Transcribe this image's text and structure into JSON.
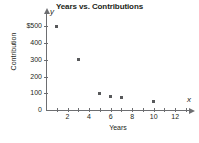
{
  "chart_data": {
    "type": "scatter",
    "title": "Years vs. Contributions",
    "xlabel": "Years",
    "ylabel": "Contribution",
    "x_axis_letter": "x",
    "y_axis_letter": "y",
    "xlim": [
      0,
      13
    ],
    "ylim": [
      0,
      550
    ],
    "grid": false,
    "legend": false,
    "marker_color": "#58595b",
    "axis_color": "#6d6e71",
    "text_color": "#231f20",
    "background_color": "#ffffff",
    "x_ticks": [
      1,
      2,
      3,
      4,
      5,
      6,
      7,
      8,
      9,
      10,
      11,
      12,
      13
    ],
    "x_tick_labels": [
      {
        "value": 2,
        "label": "2"
      },
      {
        "value": 4,
        "label": "4"
      },
      {
        "value": 6,
        "label": "6"
      },
      {
        "value": 8,
        "label": "8"
      },
      {
        "value": 10,
        "label": "10"
      },
      {
        "value": 12,
        "label": "12"
      }
    ],
    "y_ticks": [
      0,
      100,
      200,
      300,
      400,
      500
    ],
    "y_tick_labels": [
      {
        "value": 0,
        "label": "0"
      },
      {
        "value": 100,
        "label": "100"
      },
      {
        "value": 200,
        "label": "200"
      },
      {
        "value": 300,
        "label": "300"
      },
      {
        "value": 400,
        "label": "400"
      },
      {
        "value": 500,
        "label": "$500"
      }
    ],
    "points": [
      {
        "x": 1,
        "y": 500
      },
      {
        "x": 3,
        "y": 300
      },
      {
        "x": 5,
        "y": 100
      },
      {
        "x": 6,
        "y": 80
      },
      {
        "x": 7,
        "y": 75
      },
      {
        "x": 10,
        "y": 50
      }
    ]
  }
}
